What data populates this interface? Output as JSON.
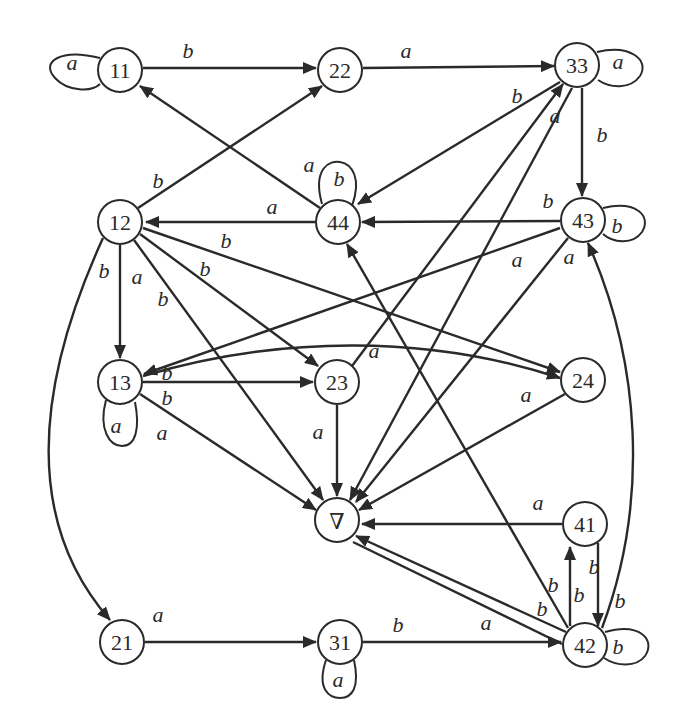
{
  "diagram": {
    "type": "state-transition-graph",
    "nodes": [
      {
        "id": "n11",
        "label": "11",
        "x": 120,
        "y": 70
      },
      {
        "id": "n22",
        "label": "22",
        "x": 340,
        "y": 70
      },
      {
        "id": "n33",
        "label": "33",
        "x": 577,
        "y": 65
      },
      {
        "id": "n12",
        "label": "12",
        "x": 120,
        "y": 222
      },
      {
        "id": "n44",
        "label": "44",
        "x": 338,
        "y": 222
      },
      {
        "id": "n43",
        "label": "43",
        "x": 583,
        "y": 220
      },
      {
        "id": "n13",
        "label": "13",
        "x": 120,
        "y": 382
      },
      {
        "id": "n23",
        "label": "23",
        "x": 337,
        "y": 382
      },
      {
        "id": "n24",
        "label": "24",
        "x": 583,
        "y": 380
      },
      {
        "id": "nsink",
        "label": "∇",
        "x": 337,
        "y": 520
      },
      {
        "id": "n41",
        "label": "41",
        "x": 585,
        "y": 524
      },
      {
        "id": "n21",
        "label": "21",
        "x": 122,
        "y": 642
      },
      {
        "id": "n31",
        "label": "31",
        "x": 340,
        "y": 642
      },
      {
        "id": "n42",
        "label": "42",
        "x": 585,
        "y": 645
      }
    ],
    "edges": [
      {
        "from": "11",
        "to": "11",
        "label": "a"
      },
      {
        "from": "11",
        "to": "22",
        "label": "b"
      },
      {
        "from": "22",
        "to": "33",
        "label": "a"
      },
      {
        "from": "33",
        "to": "33",
        "label": "a"
      },
      {
        "from": "33",
        "to": "43",
        "label": "b"
      },
      {
        "from": "33",
        "to": "44",
        "label": "b"
      },
      {
        "from": "33",
        "to": "∇",
        "label": "a"
      },
      {
        "from": "23",
        "to": "33",
        "label": "a"
      },
      {
        "from": "44",
        "to": "44",
        "label": "b"
      },
      {
        "from": "44",
        "to": "11",
        "label": "a"
      },
      {
        "from": "44",
        "to": "12",
        "label": "a"
      },
      {
        "from": "43",
        "to": "44",
        "label": "b"
      },
      {
        "from": "43",
        "to": "43",
        "label": "b"
      },
      {
        "from": "43",
        "to": "13",
        "label": "a"
      },
      {
        "from": "43",
        "to": "∇",
        "label": "a"
      },
      {
        "from": "12",
        "to": "22",
        "label": "b"
      },
      {
        "from": "12",
        "to": "13",
        "label": "a"
      },
      {
        "from": "12",
        "to": "21",
        "label": "b"
      },
      {
        "from": "12",
        "to": "23",
        "label": "b"
      },
      {
        "from": "12",
        "to": "24",
        "label": "b"
      },
      {
        "from": "12",
        "to": "∇",
        "label": "b"
      },
      {
        "from": "13",
        "to": "13",
        "label": "a"
      },
      {
        "from": "13",
        "to": "23",
        "label": "b"
      },
      {
        "from": "13",
        "to": "24",
        "label": "b"
      },
      {
        "from": "13",
        "to": "∇",
        "label": "a"
      },
      {
        "from": "23",
        "to": "∇",
        "label": "a"
      },
      {
        "from": "24",
        "to": "∇",
        "label": "a"
      },
      {
        "from": "41",
        "to": "∇",
        "label": "a"
      },
      {
        "from": "41",
        "to": "42",
        "label": "b"
      },
      {
        "from": "42",
        "to": "41",
        "label": "b"
      },
      {
        "from": "42",
        "to": "43",
        "label": "b"
      },
      {
        "from": "42",
        "to": "44",
        "label": "b"
      },
      {
        "from": "42",
        "to": "∇",
        "label": "b"
      },
      {
        "from": "42",
        "to": "∇",
        "label": "a"
      },
      {
        "from": "42",
        "to": "42",
        "label": "b"
      },
      {
        "from": "21",
        "to": "31",
        "label": "a"
      },
      {
        "from": "31",
        "to": "31",
        "label": "a"
      },
      {
        "from": "31",
        "to": "42",
        "label": "b"
      }
    ],
    "labels": {
      "e11_11": "a",
      "e11_22": "b",
      "e22_33": "a",
      "e33_33": "a",
      "e33_43": "b",
      "e33_44": "b",
      "e33_sink": "a",
      "e23_33": "a",
      "e44_44": "b",
      "e44_11": "a",
      "e44_12": "a",
      "e43_44": "b",
      "e43_43": "b",
      "e43_13": "a",
      "e43_sink": "a",
      "e12_22": "b",
      "e12_13": "a",
      "e12_21": "b",
      "e12_23": "b",
      "e12_24": "b",
      "e12_sink": "b",
      "e13_13": "a",
      "e13_23": "b",
      "e13_24": "b",
      "e13_sink": "a",
      "e23_sink": "a",
      "e24_sink": "a",
      "e41_sink": "a",
      "e41_42": "b",
      "e42_41": "b",
      "e42_43": "b",
      "e42_44": "b",
      "e42_sink_b": "b",
      "e42_sink_a": "a",
      "e42_42": "b",
      "e21_31": "a",
      "e31_31": "a",
      "e31_42": "b"
    },
    "node_labels": {
      "n11": "11",
      "n22": "22",
      "n33": "33",
      "n12": "12",
      "n44": "44",
      "n43": "43",
      "n13": "13",
      "n23": "23",
      "n24": "24",
      "nsink": "∇",
      "n41": "41",
      "n21": "21",
      "n31": "31",
      "n42": "42"
    }
  }
}
